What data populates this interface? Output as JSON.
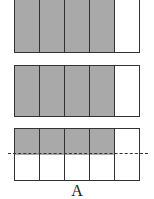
{
  "figure": {
    "label": "A",
    "fill_color": "#a9a9a9",
    "line_color": "#333333",
    "bars": [
      {
        "name": "bar-1",
        "columns": 5,
        "shaded_columns": 4,
        "shading": "full"
      },
      {
        "name": "bar-2",
        "columns": 5,
        "shaded_columns": 4,
        "shading": "full"
      },
      {
        "name": "bar-3",
        "columns": 5,
        "shaded_columns": 4,
        "shading": "top-half",
        "dashed_midline": true
      }
    ]
  }
}
